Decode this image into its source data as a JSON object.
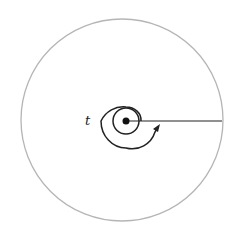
{
  "diagram": {
    "type": "spiral-in-circle",
    "label": "t",
    "colors": {
      "outer_circle": "#b5b5b5",
      "spiral": "#222222",
      "line": "#222222",
      "dot": "#111111",
      "background": "#ffffff"
    },
    "elements": [
      {
        "name": "outer-circle",
        "shape": "circle"
      },
      {
        "name": "spiral",
        "shape": "spiral",
        "turns": 2,
        "direction": "counterclockwise-outward"
      },
      {
        "name": "center-dot",
        "shape": "dot"
      },
      {
        "name": "radius-line",
        "shape": "line",
        "from": "center",
        "to": "right edge"
      },
      {
        "name": "arrowhead",
        "shape": "arrow",
        "points": "up"
      }
    ]
  }
}
